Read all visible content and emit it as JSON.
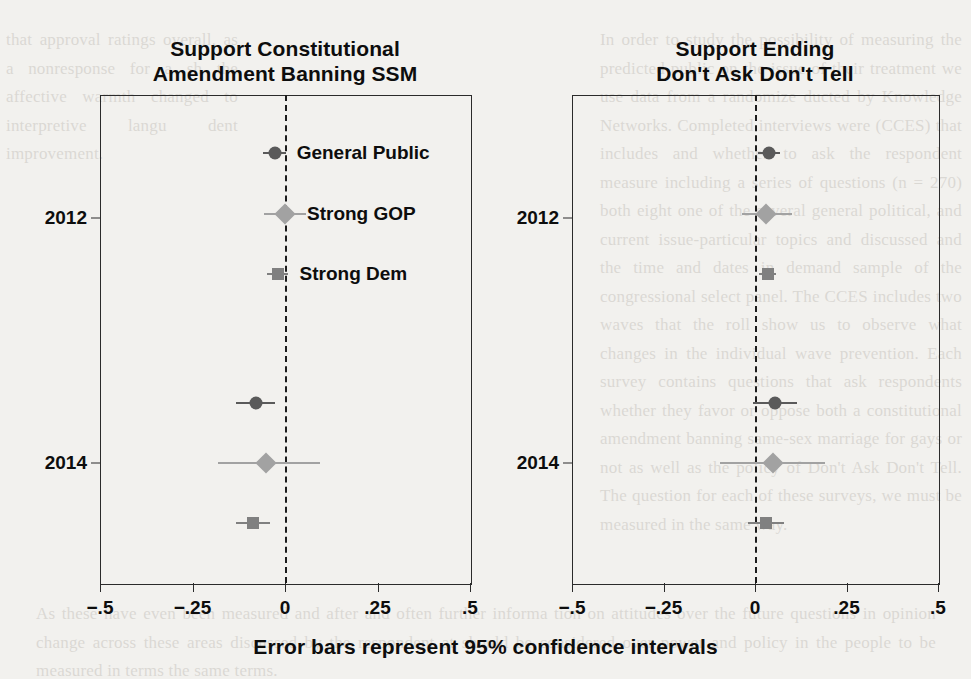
{
  "caption": "Error bars represent 95% confidence intervals",
  "background_text": {
    "left_column": "that approval ratings overall, as a nonresponse for a sh the affective warmth changed to interpretive langu dent improvement.",
    "right_column": "In order to study the possibility of measuring the predicted public on the issue of their treatment we use data from a randomize ducted by Knowledge Networks. Completed interviews were (CCES) that includes and whether to ask the respondent measure including a series of questions (n = 270) both eight one of the several general political, and current issue-particular topics and discussed and the time and dates in demand sample of the congressional select panel. The CCES includes two waves that the roll show us to observe what changes in the individual wave prevention. Each survey contains questions that ask respondents whether they favor or oppose both a constitutional amendment banning same-sex marriage for gays or not as well as the policy of Don't Ask Don't Tell. The question for each of these surveys, we must be measured in the same way.",
    "bottom": "As these have even been measured and after and often further informa tion on attitudes over the future questions in opinion change across these areas discussed by the respondent at should be considered over power and policy in the people to be measured in terms the same terms."
  },
  "chart_data": {
    "type": "scatter",
    "caption": "Error bars represent 95% confidence intervals",
    "xlabel": "",
    "ylabel": "",
    "xlim": [
      -0.5,
      0.5
    ],
    "xticks": [
      -0.5,
      -0.25,
      0,
      0.25,
      0.5
    ],
    "xtick_labels": [
      "−.5",
      "−.25",
      "0",
      ".25",
      ".5"
    ],
    "ytick_labels": [
      "2012",
      "2014"
    ],
    "grid": false,
    "zero_reference_line": 0,
    "legend": "inline-labels",
    "series_styles": [
      {
        "name": "General Public",
        "marker": "circle",
        "color": "#5a5a5a",
        "size": 13
      },
      {
        "name": "Strong GOP",
        "marker": "diamond",
        "color": "#a2a2a2",
        "size": 15
      },
      {
        "name": "Strong Dem",
        "marker": "square",
        "color": "#808080",
        "size": 12
      }
    ],
    "panels": [
      {
        "id": "left",
        "title": "Support Constitutional\nAmendment Banning SSM",
        "title_line1": "Support Constitutional",
        "title_line2": "Amendment Banning SSM",
        "groups": [
          {
            "year": "2012",
            "points": [
              {
                "series": "General Public",
                "estimate": -0.028,
                "ci_low": -0.06,
                "ci_high": 0.004,
                "label": "General Public"
              },
              {
                "series": "Strong GOP",
                "estimate": 0.0,
                "ci_low": -0.058,
                "ci_high": 0.058,
                "label": "Strong GOP"
              },
              {
                "series": "Strong Dem",
                "estimate": -0.02,
                "ci_low": -0.048,
                "ci_high": 0.008,
                "label": "Strong Dem"
              }
            ]
          },
          {
            "year": "2014",
            "points": [
              {
                "series": "General Public",
                "estimate": -0.078,
                "ci_low": -0.132,
                "ci_high": -0.026,
                "label": ""
              },
              {
                "series": "Strong GOP",
                "estimate": -0.052,
                "ci_low": -0.182,
                "ci_high": 0.095,
                "label": ""
              },
              {
                "series": "Strong Dem",
                "estimate": -0.086,
                "ci_low": -0.132,
                "ci_high": -0.04,
                "label": ""
              }
            ]
          }
        ]
      },
      {
        "id": "right",
        "title": "Support Ending\nDon't Ask Don't Tell",
        "title_line1": "Support Ending",
        "title_line2": "Don't Ask Don't Tell",
        "groups": [
          {
            "year": "2012",
            "points": [
              {
                "series": "General Public",
                "estimate": 0.038,
                "ci_low": 0.009,
                "ci_high": 0.067,
                "label": ""
              },
              {
                "series": "Strong GOP",
                "estimate": 0.03,
                "ci_low": -0.035,
                "ci_high": 0.1,
                "label": ""
              },
              {
                "series": "Strong Dem",
                "estimate": 0.035,
                "ci_low": 0.012,
                "ci_high": 0.058,
                "label": ""
              }
            ]
          },
          {
            "year": "2014",
            "points": [
              {
                "series": "General Public",
                "estimate": 0.055,
                "ci_low": -0.005,
                "ci_high": 0.115,
                "label": ""
              },
              {
                "series": "Strong GOP",
                "estimate": 0.048,
                "ci_low": -0.095,
                "ci_high": 0.19,
                "label": ""
              },
              {
                "series": "Strong Dem",
                "estimate": 0.03,
                "ci_low": -0.018,
                "ci_high": 0.078,
                "label": ""
              }
            ]
          }
        ]
      }
    ]
  }
}
